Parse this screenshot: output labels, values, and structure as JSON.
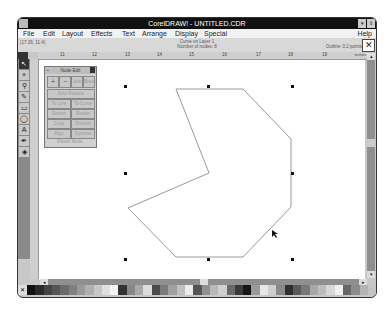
{
  "window": {
    "title": "CorelDRAW! - UNTITLED.CDR",
    "minimize_label": "▾",
    "restore_label": "⇕"
  },
  "menubar": {
    "items": [
      "File",
      "Edit",
      "Layout",
      "Effects",
      "Text",
      "Arrange",
      "Display",
      "Special"
    ],
    "help": "Help"
  },
  "status": {
    "coords": "(17.26, 11.4)",
    "object_line1": "Curve on Layer 1",
    "object_line2": "Number of nodes: 8",
    "outline": "Outline: 0.2 points",
    "close_icon": "✕"
  },
  "ruler": {
    "labels": [
      "11",
      "12",
      "13",
      "14",
      "15",
      "16",
      "17",
      "18",
      "19"
    ],
    "units": "inches"
  },
  "toolbox": {
    "tools": [
      {
        "name": "pick-tool",
        "glyph": "↖"
      },
      {
        "name": "shape-tool",
        "glyph": "⌖"
      },
      {
        "name": "zoom-tool",
        "glyph": "⚲"
      },
      {
        "name": "pencil-tool",
        "glyph": "✎"
      },
      {
        "name": "rectangle-tool",
        "glyph": "▭"
      },
      {
        "name": "ellipse-tool",
        "glyph": "◯"
      },
      {
        "name": "text-tool",
        "glyph": "A"
      },
      {
        "name": "outline-tool",
        "glyph": "✒"
      },
      {
        "name": "fill-tool",
        "glyph": "◈"
      }
    ]
  },
  "node_edit": {
    "title": "Node Edit",
    "buttons": {
      "add": "+",
      "delete": "−",
      "join": "Join",
      "break": "Break",
      "auto_reduce": "Auto-Reduce",
      "to_line": "To Line",
      "to_curve": "To Curve",
      "stretch": "Stretch",
      "rotate": "Rotate",
      "cusp": "Cusp",
      "smooth": "Smooth",
      "align": "Align",
      "symmet": "Symmet",
      "elastic_mode": "Elastic Mode"
    }
  },
  "drawing": {
    "shape": "Curve",
    "node_count": 8,
    "outline_color": "#9a9a9a"
  },
  "scroll": {
    "up": "▴",
    "down": "▾",
    "left": "◂",
    "right": "▸"
  },
  "palette": {
    "no_color": "✕",
    "colors": [
      "#111111",
      "#2a2a2a",
      "#444444",
      "#555555",
      "#6a6a6a",
      "#808080",
      "#999999",
      "#b0b0b0",
      "#c8c8c8",
      "#e0e0e0",
      "#f5f5f5",
      "#333333",
      "#888888",
      "#aaaaaa",
      "#dddddd",
      "#4a4a4a",
      "#7a7a7a",
      "#a0a0a0",
      "#c0c0c0",
      "#ececec",
      "#555555",
      "#909090",
      "#b8b8b8",
      "#d0d0d0",
      "#6a6a6a",
      "#3a3a3a",
      "#151515",
      "#9a9a9a",
      "#e8e8e8",
      "#cfcfcf",
      "#8a8a8a",
      "#2e2e2e",
      "#5a5a5a",
      "#787878",
      "#a8a8a8",
      "#bdbdbd",
      "#d8d8d8",
      "#f0f0f0",
      "#666666",
      "#8c8c8c",
      "#b4b4b4",
      "#c4c4c4"
    ]
  }
}
